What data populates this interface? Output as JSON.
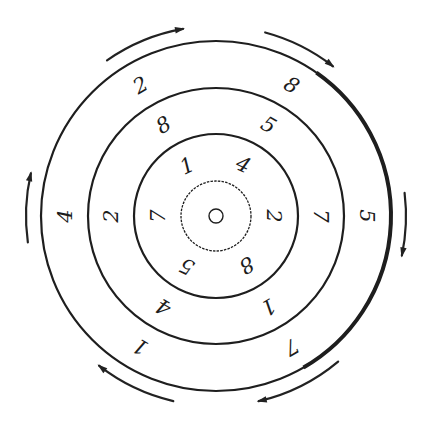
{
  "figure": {
    "center": {
      "x": 216,
      "y": 216
    },
    "stroke_color": "#1e1e1e",
    "rings": [
      {
        "id": "center-dot",
        "radius": 7,
        "style": "thin"
      },
      {
        "id": "ring-1",
        "radius": 35,
        "style": "dashed-thin"
      },
      {
        "id": "ring-2",
        "radius": 82,
        "style": "solid"
      },
      {
        "id": "ring-3",
        "radius": 128,
        "style": "solid"
      },
      {
        "id": "ring-4",
        "radius": 175,
        "style": "solid-heavy-right"
      }
    ],
    "bands": [
      {
        "id": "band-inner",
        "label_radius": 58,
        "labels": [
          {
            "text": "1",
            "angle": -120,
            "rotate": -25
          },
          {
            "text": "4",
            "angle": -62,
            "rotate": 25
          },
          {
            "text": "2",
            "angle": 0,
            "rotate": 90
          },
          {
            "text": "8",
            "angle": 58,
            "rotate": 150
          },
          {
            "text": "5",
            "angle": 120,
            "rotate": 205
          },
          {
            "text": "7",
            "angle": 180,
            "rotate": 270
          }
        ]
      },
      {
        "id": "band-middle",
        "label_radius": 105,
        "labels": [
          {
            "text": "8",
            "angle": -120,
            "rotate": -30
          },
          {
            "text": "5",
            "angle": -60,
            "rotate": 30
          },
          {
            "text": "7",
            "angle": 0,
            "rotate": 90
          },
          {
            "text": "1",
            "angle": 60,
            "rotate": 150
          },
          {
            "text": "4",
            "angle": 120,
            "rotate": 210
          },
          {
            "text": "2",
            "angle": 180,
            "rotate": 270
          }
        ]
      },
      {
        "id": "band-outer",
        "label_radius": 151,
        "labels": [
          {
            "text": "2",
            "angle": -120,
            "rotate": -30
          },
          {
            "text": "8",
            "angle": -60,
            "rotate": 30
          },
          {
            "text": "5",
            "angle": 0,
            "rotate": 90
          },
          {
            "text": "7",
            "angle": 60,
            "rotate": 150
          },
          {
            "text": "1",
            "angle": 120,
            "rotate": 210
          },
          {
            "text": "4",
            "angle": 180,
            "rotate": 270
          }
        ]
      }
    ],
    "arrows": {
      "direction": "clockwise",
      "radius": 190,
      "items": [
        {
          "id": "arrow-top-left",
          "start_angle": -125,
          "end_angle": -100
        },
        {
          "id": "arrow-top-right",
          "start_angle": -75,
          "end_angle": -52
        },
        {
          "id": "arrow-right",
          "start_angle": -7,
          "end_angle": 12
        },
        {
          "id": "arrow-bottom-right",
          "start_angle": 50,
          "end_angle": 77
        },
        {
          "id": "arrow-bottom-left",
          "start_angle": 103,
          "end_angle": 128
        },
        {
          "id": "arrow-left",
          "start_angle": 172,
          "end_angle": 193
        }
      ]
    }
  }
}
